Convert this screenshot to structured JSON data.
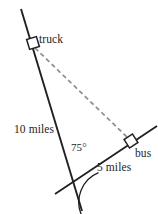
{
  "figure": {
    "background_color": "#ffffff",
    "line_color": "#231f20",
    "dashed_line_color": "#8d8d8d",
    "text_color": "#231f20",
    "marker_fill": "#ffffff",
    "labels": {
      "truck": "truck",
      "bus": "bus",
      "truck_distance": "10 miles",
      "bus_distance": "5 miles",
      "angle": "75°"
    },
    "markers": [
      {
        "name": "truck",
        "shape": "square",
        "x": 33,
        "y": 43
      },
      {
        "name": "bus",
        "shape": "square",
        "x": 131,
        "y": 141
      }
    ],
    "vertex": {
      "x": 72,
      "y": 184
    },
    "segments": [
      {
        "name": "truck-road",
        "style": "solid",
        "x1": 21,
        "y1": 9,
        "x2": 82,
        "y2": 211
      },
      {
        "name": "bus-road",
        "style": "solid",
        "x1": 55,
        "y1": 194,
        "x2": 157,
        "y2": 126
      },
      {
        "name": "truck-to-bus",
        "style": "dashed",
        "x1": 35,
        "y1": 48,
        "x2": 128,
        "y2": 138
      }
    ],
    "angle_arc": {
      "center_x": 72,
      "center_y": 184,
      "radius": 32,
      "measure": "75°"
    }
  }
}
